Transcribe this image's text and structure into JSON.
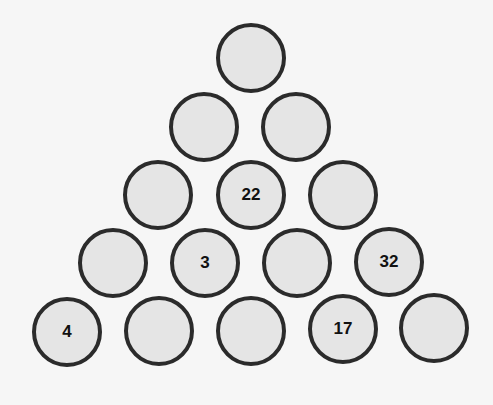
{
  "puzzle": {
    "type": "number-pyramid",
    "rows": [
      [
        ""
      ],
      [
        "",
        ""
      ],
      [
        "",
        "22",
        ""
      ],
      [
        "",
        "3",
        "",
        "32"
      ],
      [
        "4",
        "",
        "",
        "17",
        ""
      ]
    ]
  },
  "colors": {
    "background": "#f6f6f6",
    "circle_fill": "#e5e5e5",
    "circle_border": "#2b2b2b",
    "text": "#111111"
  }
}
